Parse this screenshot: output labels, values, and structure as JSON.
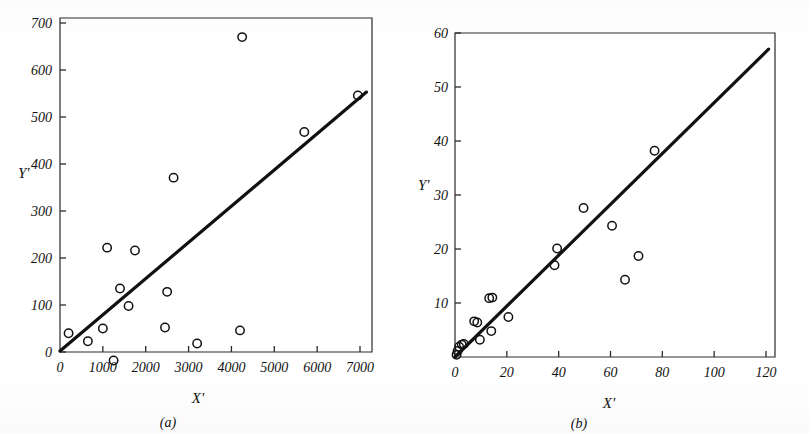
{
  "figure": {
    "background_color": "#ffffff",
    "ink_color": "#111111",
    "panels": [
      "a",
      "b"
    ]
  },
  "chart_data": [
    {
      "type": "scatter",
      "panel": "(a)",
      "title": "",
      "xlabel": "X'",
      "ylabel": "Y'",
      "xlim": [
        0,
        7300
      ],
      "ylim": [
        -30,
        700
      ],
      "grid": false,
      "legend": "none",
      "xticks": [
        0,
        1000,
        2000,
        3000,
        4000,
        5000,
        6000,
        7000
      ],
      "xticklabels": [
        "0",
        "1000",
        "2000",
        "3000",
        "4000",
        "5000",
        "6000",
        "7000"
      ],
      "yticks": [
        0,
        100,
        200,
        300,
        400,
        500,
        600,
        700
      ],
      "yticklabels": [
        "0",
        "100",
        "200",
        "300",
        "400",
        "500",
        "600",
        "700"
      ],
      "points": [
        {
          "x": 200,
          "y": 40
        },
        {
          "x": 650,
          "y": 23
        },
        {
          "x": 1000,
          "y": 50
        },
        {
          "x": 1100,
          "y": 222
        },
        {
          "x": 1250,
          "y": -18
        },
        {
          "x": 1400,
          "y": 135
        },
        {
          "x": 1600,
          "y": 98
        },
        {
          "x": 1750,
          "y": 216
        },
        {
          "x": 2450,
          "y": 52
        },
        {
          "x": 2500,
          "y": 128
        },
        {
          "x": 2650,
          "y": 371
        },
        {
          "x": 3200,
          "y": 18
        },
        {
          "x": 4200,
          "y": 46
        },
        {
          "x": 4250,
          "y": 670
        },
        {
          "x": 5700,
          "y": 468
        },
        {
          "x": 6950,
          "y": 546
        }
      ],
      "fit_line": {
        "x0": 0,
        "y0": 2,
        "x1": 7150,
        "y1": 553
      }
    },
    {
      "type": "scatter",
      "panel": "(b)",
      "title": "",
      "xlabel": "X'",
      "ylabel": "Y'",
      "xlim": [
        0,
        124
      ],
      "ylim": [
        0,
        60
      ],
      "grid": false,
      "legend": "none",
      "xticks": [
        0,
        20,
        40,
        60,
        80,
        100,
        120
      ],
      "xticklabels": [
        "0",
        "20",
        "40",
        "60",
        "80",
        "100",
        "120"
      ],
      "yticks": [
        10,
        20,
        30,
        40,
        50,
        60
      ],
      "yticklabels": [
        "10",
        "20",
        "30",
        "40",
        "50",
        "60"
      ],
      "points": [
        {
          "x": 0.6,
          "y": 0.4
        },
        {
          "x": 1.0,
          "y": 1.1
        },
        {
          "x": 1.6,
          "y": 1.9
        },
        {
          "x": 2.6,
          "y": 2.3
        },
        {
          "x": 3.4,
          "y": 2.4
        },
        {
          "x": 7.4,
          "y": 6.6
        },
        {
          "x": 8.6,
          "y": 6.4
        },
        {
          "x": 9.6,
          "y": 3.2
        },
        {
          "x": 13.2,
          "y": 10.9
        },
        {
          "x": 14.4,
          "y": 11.0
        },
        {
          "x": 14.0,
          "y": 4.8
        },
        {
          "x": 20.6,
          "y": 7.4
        },
        {
          "x": 38.4,
          "y": 17.0
        },
        {
          "x": 39.4,
          "y": 20.1
        },
        {
          "x": 49.6,
          "y": 27.6
        },
        {
          "x": 60.6,
          "y": 24.3
        },
        {
          "x": 65.6,
          "y": 14.3
        },
        {
          "x": 70.8,
          "y": 18.7
        },
        {
          "x": 77.0,
          "y": 38.2
        }
      ],
      "fit_line": {
        "x0": 0,
        "y0": 0,
        "x1": 121,
        "y1": 57
      }
    }
  ]
}
